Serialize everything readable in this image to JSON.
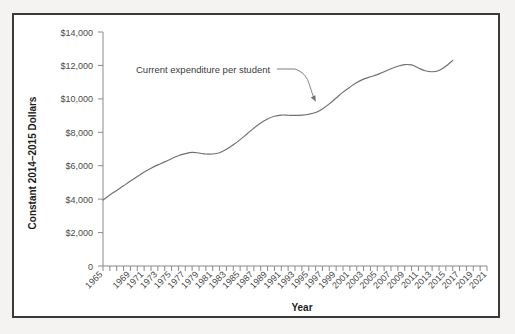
{
  "chart_data": {
    "type": "line",
    "title": "",
    "xlabel": "Year",
    "ylabel": "Constant 2014–2015 Dollars",
    "xlim": [
      1965,
      2021
    ],
    "ylim": [
      0,
      14000
    ],
    "grid": false,
    "legend": "none",
    "y_ticks": [
      0,
      2000,
      4000,
      6000,
      8000,
      10000,
      12000,
      14000
    ],
    "y_tick_labels": [
      "0",
      "$2,000",
      "$4,000",
      "$6,000",
      "$8,000",
      "$10,000",
      "$12,000",
      "$14,000"
    ],
    "x_tick_labels": [
      "1965",
      "1969",
      "1971",
      "1973",
      "1975",
      "1977",
      "1979",
      "1981",
      "1983",
      "1985",
      "1987",
      "1989",
      "1991",
      "1993",
      "1995",
      "1997",
      "1999",
      "2001",
      "2003",
      "2005",
      "2007",
      "2009",
      "2011",
      "2013",
      "2015",
      "2017",
      "2019",
      "2021"
    ],
    "annotations": [
      {
        "text": "Current expenditure per student",
        "points_to_x": 1996,
        "points_to_y": 9850
      }
    ],
    "series": [
      {
        "name": "Current expenditure per student",
        "x": [
          1965,
          1966,
          1967,
          1968,
          1969,
          1970,
          1971,
          1972,
          1973,
          1974,
          1975,
          1976,
          1977,
          1978,
          1979,
          1980,
          1981,
          1982,
          1983,
          1984,
          1985,
          1986,
          1987,
          1988,
          1989,
          1990,
          1991,
          1992,
          1993,
          1994,
          1995,
          1996,
          1997,
          1998,
          1999,
          2000,
          2001,
          2002,
          2003,
          2004,
          2005,
          2006,
          2007,
          2008,
          2009,
          2010,
          2011,
          2012,
          2013,
          2014,
          2015,
          2016
        ],
        "values": [
          3950,
          4250,
          4520,
          4800,
          5080,
          5350,
          5620,
          5850,
          6050,
          6230,
          6420,
          6600,
          6720,
          6800,
          6760,
          6700,
          6700,
          6780,
          6980,
          7250,
          7560,
          7900,
          8250,
          8560,
          8800,
          8960,
          9030,
          9020,
          9010,
          9030,
          9080,
          9180,
          9400,
          9700,
          10050,
          10400,
          10700,
          10980,
          11180,
          11320,
          11450,
          11620,
          11800,
          11950,
          12050,
          12030,
          11850,
          11680,
          11620,
          11700,
          11950,
          12300
        ]
      }
    ]
  },
  "axis": {
    "y_title": "Constant 2014–2015 Dollars",
    "x_title": "Year"
  },
  "annotation": {
    "label": "Current expenditure per student"
  }
}
